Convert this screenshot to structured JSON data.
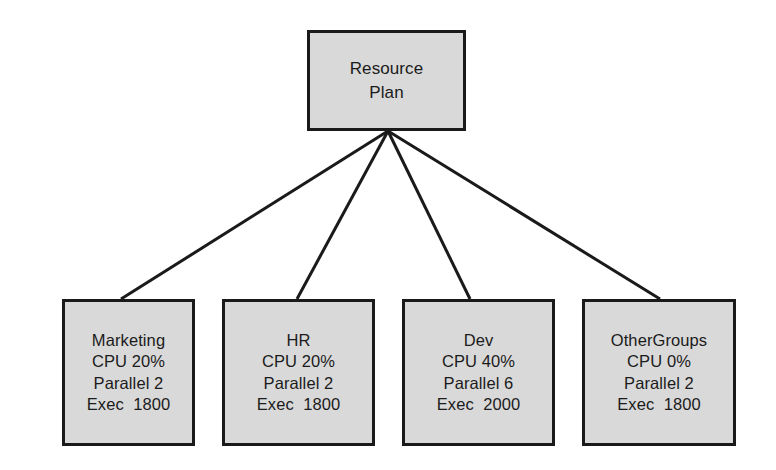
{
  "diagram": {
    "type": "tree",
    "colors": {
      "background": "#ffffff",
      "node_fill": "#d9d9d9",
      "node_border": "#1a1a1a",
      "edge": "#1a1a1a",
      "text": "#1b1b1b"
    },
    "root": {
      "id": "resource-plan",
      "lines": [
        "Resource",
        "Plan"
      ]
    },
    "children": [
      {
        "id": "marketing",
        "name": "Marketing",
        "cpu": "CPU 20%",
        "parallel": "Parallel 2",
        "exec": "Exec  1800",
        "lines": [
          "Marketing",
          "CPU 20%",
          "Parallel 2",
          "Exec  1800"
        ]
      },
      {
        "id": "hr",
        "name": "HR",
        "cpu": "CPU 20%",
        "parallel": "Parallel 2",
        "exec": "Exec  1800",
        "lines": [
          "HR",
          "CPU 20%",
          "Parallel 2",
          "Exec  1800"
        ]
      },
      {
        "id": "dev",
        "name": "Dev",
        "cpu": "CPU 40%",
        "parallel": "Parallel 6",
        "exec": "Exec  2000",
        "lines": [
          "Dev",
          "CPU 40%",
          "Parallel 6",
          "Exec  2000"
        ]
      },
      {
        "id": "othergroups",
        "name": "OtherGroups",
        "cpu": "CPU 0%",
        "parallel": "Parallel 2",
        "exec": "Exec  1800",
        "lines": [
          "OtherGroups",
          "CPU 0%",
          "Parallel 2",
          "Exec  1800"
        ]
      }
    ]
  }
}
